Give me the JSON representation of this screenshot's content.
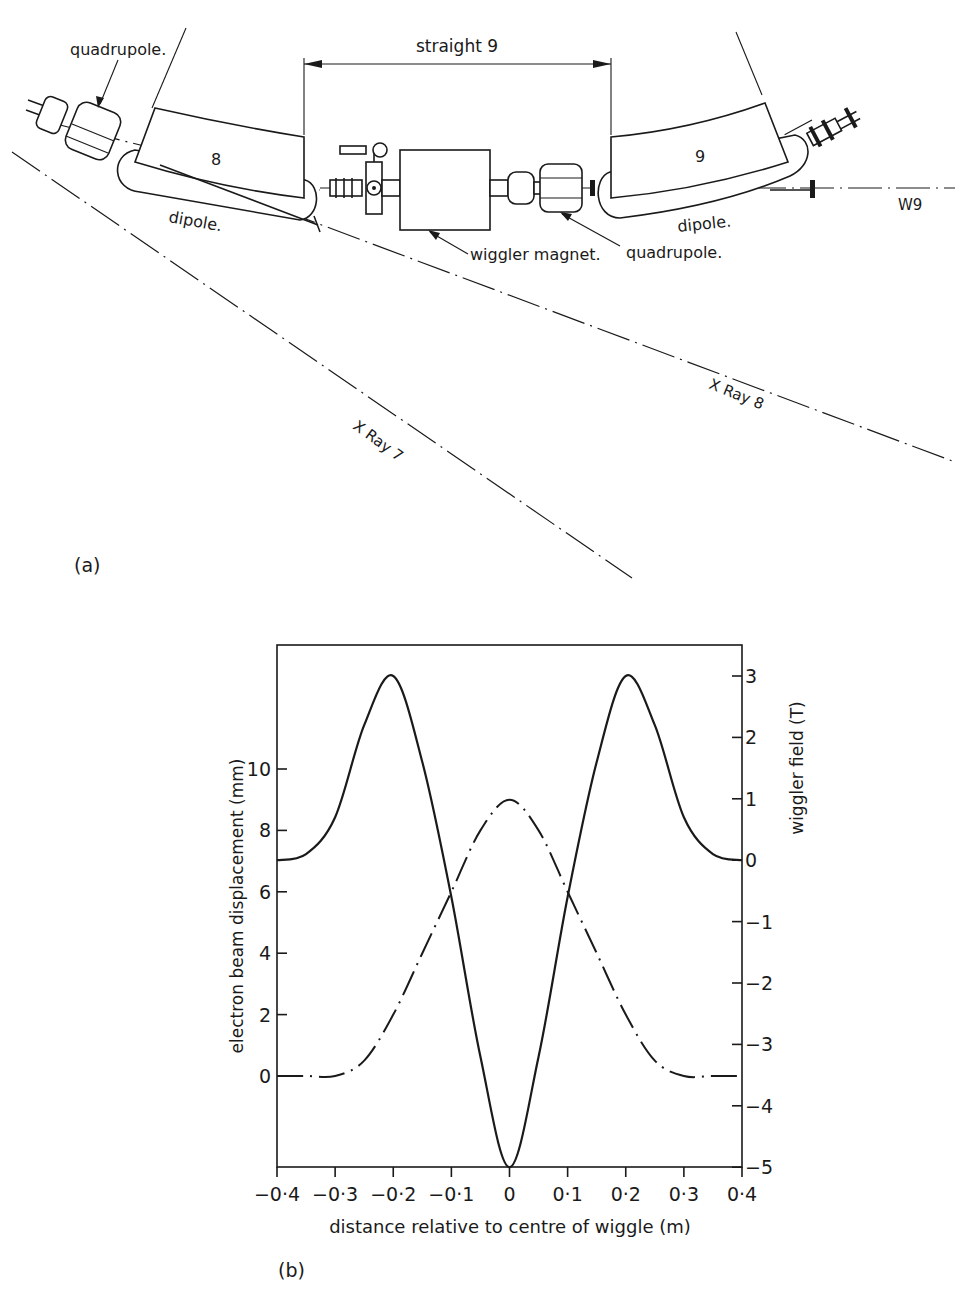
{
  "panel_a": {
    "label": "(a)",
    "straight_label": "straight 9",
    "dipole_left_number": "8",
    "dipole_right_number": "9",
    "labels": {
      "quadrupole_left": "quadrupole.",
      "quadrupole_right": "quadrupole.",
      "dipole_left": "dipole.",
      "dipole_right": "dipole.",
      "wiggler": "wiggler magnet.",
      "w9": "W9",
      "xray7": "X Ray 7",
      "xray8": "X Ray 8"
    }
  },
  "panel_b": {
    "label": "(b)"
  },
  "chart_data": {
    "type": "line",
    "title": "",
    "xlabel": "distance relative to centre of wiggle (m)",
    "ylabel_left": "electron beam displacement (mm)",
    "ylabel_right": "wiggler field (T)",
    "xlim": [
      -0.4,
      0.4
    ],
    "ylim_left": [
      -3,
      14
    ],
    "ylim_right": [
      -5,
      3.5
    ],
    "x_ticks": [
      "-0·4",
      "-0·3",
      "-0·2",
      "-0·1",
      "0",
      "0·1",
      "0·2",
      "0·3",
      "0·4"
    ],
    "y_left_ticks": [
      "0",
      "2",
      "4",
      "6",
      "8",
      "10"
    ],
    "y_right_ticks": [
      "3",
      "2",
      "1",
      "0",
      "-1",
      "-2",
      "-3",
      "-4",
      "-5"
    ],
    "grid": false,
    "legend": "none",
    "series": [
      {
        "name": "electron beam displacement (mm)",
        "axis": "left",
        "style": "dash-dot",
        "x": [
          -0.4,
          -0.35,
          -0.3,
          -0.25,
          -0.2,
          -0.15,
          -0.1,
          -0.05,
          0,
          0.05,
          0.1,
          0.15,
          0.2,
          0.25,
          0.3,
          0.35,
          0.4
        ],
        "values": [
          0,
          0,
          0,
          0.5,
          2.0,
          4.0,
          6.0,
          8.0,
          9.0,
          8.0,
          6.0,
          4.0,
          2.0,
          0.5,
          0,
          0,
          0
        ]
      },
      {
        "name": "wiggler field (T)",
        "axis": "right",
        "style": "solid",
        "x": [
          -0.4,
          -0.35,
          -0.3,
          -0.25,
          -0.2,
          -0.15,
          -0.1,
          -0.05,
          0,
          0.05,
          0.1,
          0.15,
          0.2,
          0.25,
          0.3,
          0.35,
          0.4
        ],
        "values": [
          0,
          0.1,
          0.7,
          2.2,
          3.0,
          1.6,
          -0.6,
          -3.2,
          -5.0,
          -3.2,
          -0.6,
          1.6,
          3.0,
          2.2,
          0.7,
          0.1,
          0
        ]
      }
    ]
  }
}
